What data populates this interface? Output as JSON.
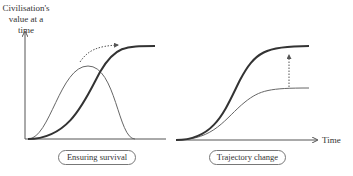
{
  "diagram": {
    "y_axis_label": "Civilisation's value at a time",
    "x_axis_label": "Time",
    "panels": [
      {
        "caption": "Ensuring survival",
        "curves": [
          "bell curve (thin)",
          "S-curve (thick)"
        ],
        "annotation": "dotted arc arrow from bell peak to S-curve plateau"
      },
      {
        "caption": "Trajectory change",
        "curves": [
          "S-curve low plateau (thin)",
          "S-curve high plateau (thick)"
        ],
        "annotation": "dotted vertical arrow from low plateau up to high plateau"
      }
    ],
    "colors": {
      "thick_line": "#333333",
      "thin_line": "#666666",
      "axis": "#555555"
    }
  }
}
